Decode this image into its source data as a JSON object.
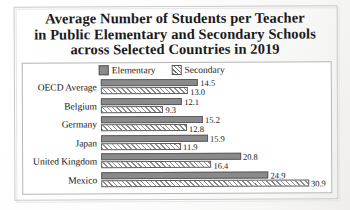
{
  "title": {
    "line1": "Average Number of Students per Teacher",
    "line2": "in Public Elementary and Secondary Schools",
    "line3": "across Selected Countries in 2019"
  },
  "legend": {
    "elementary_label": "Elementary",
    "secondary_label": "Secondary",
    "elementary_swatch": "solid-gray-square-icon",
    "secondary_swatch": "hatched-square-icon"
  },
  "categories": [
    "OECD Average",
    "Belgium",
    "Germany",
    "Japan",
    "United Kingdom",
    "Mexico"
  ],
  "values": {
    "elementary": [
      "14.5",
      "12.1",
      "15.2",
      "15.9",
      "20.8",
      "24.9"
    ],
    "secondary": [
      "13.0",
      "9.3",
      "12.8",
      "11.9",
      "16.4",
      "30.9"
    ]
  },
  "colors": {
    "elementary_fill": "#8a8a8a",
    "secondary_fill": "#ffffff",
    "bar_outline": "#5c5c5c",
    "frame": "#b5b5b5",
    "text": "#141414",
    "background": "#ffffff"
  },
  "chart_data": {
    "type": "bar",
    "orientation": "horizontal",
    "title": "Average Number of Students per Teacher in Public Elementary and Secondary Schools across Selected Countries in 2019",
    "xlabel": "",
    "ylabel": "",
    "categories": [
      "OECD Average",
      "Belgium",
      "Germany",
      "Japan",
      "United Kingdom",
      "Mexico"
    ],
    "series": [
      {
        "name": "Elementary",
        "values": [
          14.5,
          12.1,
          15.2,
          15.9,
          20.8,
          24.9
        ],
        "style": "solid-gray"
      },
      {
        "name": "Secondary",
        "values": [
          13.0,
          9.3,
          12.8,
          11.9,
          16.4,
          30.9
        ],
        "style": "diagonal-hatch"
      }
    ],
    "xlim": [
      0,
      30.9
    ],
    "grid": false,
    "data_labels": true,
    "legend": "top-center",
    "axis_ticks_visible": false
  },
  "scale": {
    "px_per_unit": 6.72,
    "max_value": 30.9
  }
}
